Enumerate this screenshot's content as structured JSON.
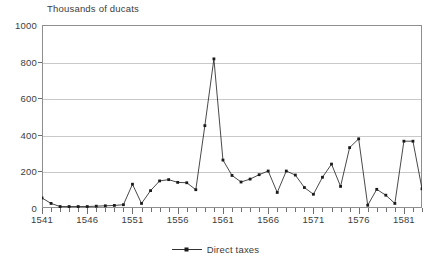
{
  "chart_data": {
    "type": "line",
    "title": "Thousands of ducats",
    "xlabel": "",
    "ylabel": "",
    "ylim": [
      0,
      1000
    ],
    "xlim": [
      1541,
      1583
    ],
    "grid": true,
    "legend_position": "bottom",
    "y_ticks": [
      0,
      200,
      400,
      600,
      800,
      1000
    ],
    "x_tick_labels": [
      "1541",
      "1546",
      "1551",
      "1556",
      "1561",
      "1566",
      "1571",
      "1576",
      "1581"
    ],
    "x_tick_values": [
      1541,
      1546,
      1551,
      1556,
      1561,
      1566,
      1571,
      1576,
      1581
    ],
    "x_minor_step": 1,
    "series": [
      {
        "name": "Direct taxes",
        "color": "#1a1a1a",
        "marker": "square",
        "x": [
          1541,
          1542,
          1543,
          1544,
          1545,
          1546,
          1547,
          1548,
          1549,
          1550,
          1551,
          1552,
          1553,
          1554,
          1555,
          1556,
          1557,
          1558,
          1559,
          1560,
          1561,
          1562,
          1563,
          1564,
          1565,
          1566,
          1567,
          1568,
          1569,
          1570,
          1571,
          1572,
          1573,
          1574,
          1575,
          1576,
          1577,
          1578,
          1579,
          1580,
          1581,
          1582,
          1583
        ],
        "values": [
          55,
          25,
          8,
          8,
          8,
          8,
          10,
          12,
          14,
          18,
          130,
          25,
          95,
          148,
          155,
          140,
          138,
          100,
          450,
          815,
          262,
          178,
          142,
          158,
          182,
          202,
          85,
          202,
          180,
          112,
          75,
          168,
          240,
          118,
          330,
          378,
          15,
          102,
          70,
          25,
          365,
          365,
          105
        ]
      }
    ]
  },
  "legend": {
    "entries": [
      {
        "label": "Direct taxes"
      }
    ]
  }
}
